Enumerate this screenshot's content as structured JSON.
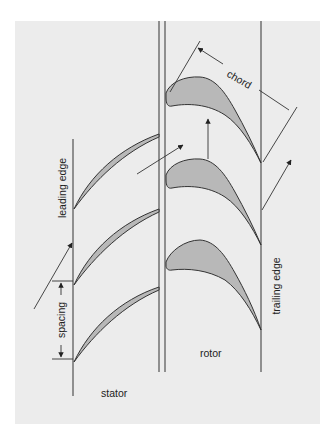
{
  "figure": {
    "background_color": "#ececec",
    "page_color": "#ffffff",
    "blade_fill": "#b8b8b8",
    "line_color": "#333333"
  },
  "labels": {
    "chord": "chord",
    "leading_edge": "leading edge",
    "trailing_edge": "trailing edge",
    "spacing": "spacing",
    "rotor": "rotor",
    "stator": "stator"
  },
  "components": {
    "stator_blades": 3,
    "rotor_blades": 3,
    "flow_arrows": 4
  },
  "caption": {
    "text": ""
  }
}
